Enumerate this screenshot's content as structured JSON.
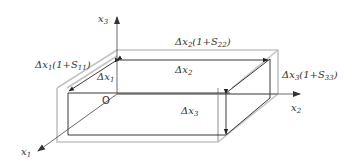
{
  "diagram": {
    "axes": {
      "x1": {
        "label": "x",
        "sub": "1"
      },
      "x2": {
        "label": "x",
        "sub": "2"
      },
      "x3": {
        "label": "x",
        "sub": "3"
      }
    },
    "origin_label": "O",
    "labels": {
      "dx1": {
        "delta": "Δ",
        "var": "x",
        "sub": "1",
        "text": "Δx1"
      },
      "dx2": {
        "delta": "Δ",
        "var": "x",
        "sub": "2",
        "text": "Δx2"
      },
      "dx3": {
        "delta": "Δ",
        "var": "x",
        "sub": "3",
        "text": "Δx3"
      },
      "dx1_def": {
        "delta": "Δ",
        "var": "x",
        "sub": "1",
        "paren_open": "(1+S",
        "s_sub": "11",
        "paren_close": ")",
        "text": "Δx1(1+S11)"
      },
      "dx2_def": {
        "delta": "Δ",
        "var": "x",
        "sub": "2",
        "paren_open": "(1+S",
        "s_sub": "22",
        "paren_close": ")",
        "text": "Δx2(1+S22)"
      },
      "dx3_def": {
        "delta": "Δ",
        "var": "x",
        "sub": "3",
        "paren_open": "(1+S",
        "s_sub": "33",
        "paren_close": ")",
        "text": "Δx3(1+S33)"
      }
    },
    "colors": {
      "deformed_box": "#c4c4c4",
      "original_box": "#222222",
      "text": "#333333"
    }
  }
}
